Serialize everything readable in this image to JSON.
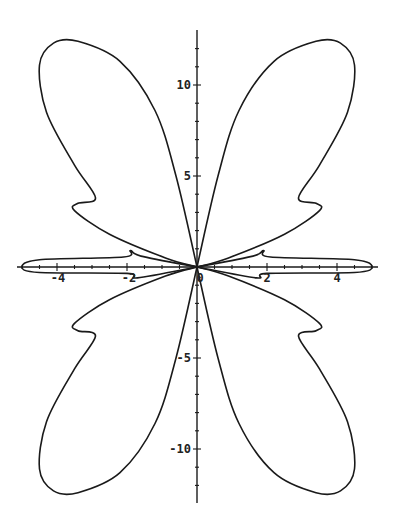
{
  "chart_data": {
    "type": "line",
    "subtype": "parametric-polar-curve",
    "title": "",
    "xlabel": "",
    "ylabel": "",
    "xlim": [
      -5.1,
      5.2
    ],
    "ylim": [
      -12.9,
      13.1
    ],
    "grid": false,
    "legend": null,
    "x_ticks": [
      -4,
      -2,
      0,
      2,
      4
    ],
    "x_tick_labels": [
      "-4",
      "-2",
      "0",
      "2",
      "4"
    ],
    "y_ticks": [
      -10,
      -5,
      5,
      10
    ],
    "y_tick_labels": [
      "-10",
      "-5",
      "5",
      "10"
    ],
    "x_minor_tick_step": 0.5,
    "y_minor_tick_step": 1,
    "series": [
      {
        "name": "curve",
        "color": "#1a1a1a",
        "points_upper_left_lobe": [
          [
            0,
            0
          ],
          [
            -0.6,
            5.0
          ],
          [
            -1.2,
            8.6
          ],
          [
            -2.2,
            11.3
          ],
          [
            -3.4,
            12.4
          ],
          [
            -4.1,
            12.3
          ],
          [
            -4.5,
            11.1
          ],
          [
            -4.3,
            8.5
          ],
          [
            -3.5,
            5.6
          ],
          [
            -2.9,
            3.8
          ],
          [
            -3.4,
            3.5
          ],
          [
            -3.5,
            3.1
          ],
          [
            -2.5,
            1.8
          ],
          [
            -0.9,
            0.5
          ],
          [
            0,
            0
          ]
        ],
        "points_left_horizontal_lobe": [
          [
            0,
            0
          ],
          [
            -1.6,
            0.6
          ],
          [
            -1.9,
            0.9
          ],
          [
            -2.1,
            0.55
          ],
          [
            -4.5,
            0.4
          ],
          [
            -5.0,
            0.0
          ],
          [
            -4.5,
            -0.3
          ],
          [
            -2.0,
            -0.35
          ],
          [
            -1.7,
            -0.6
          ],
          [
            0,
            0
          ]
        ],
        "symmetry": "mirror about x-axis and y-axis"
      }
    ]
  },
  "axes": {
    "x_axis": {
      "labels": [
        "-4",
        "-2",
        "0",
        "2",
        "4"
      ]
    },
    "y_axis": {
      "labels": [
        "10",
        "5",
        "-5",
        "-10"
      ]
    }
  }
}
